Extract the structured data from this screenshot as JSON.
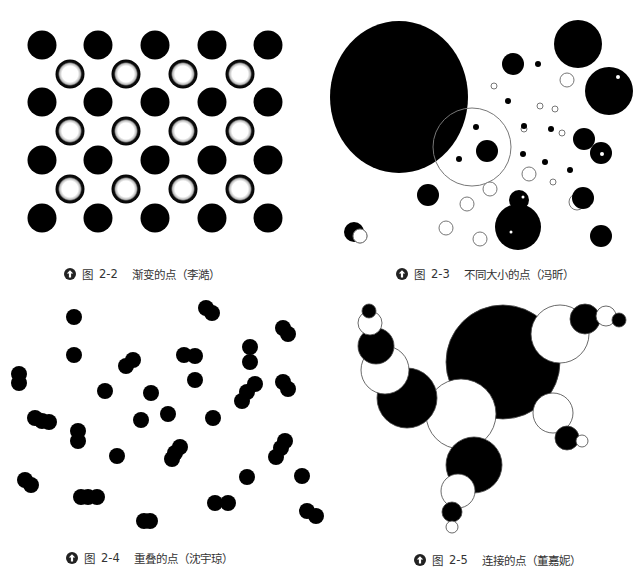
{
  "colors": {
    "ink": "#000000",
    "paper": "#ffffff",
    "outline": "#777777",
    "caption": "#333333"
  },
  "figures": [
    {
      "id": "2-2",
      "caption": {
        "prefix": "图",
        "number": "2-2",
        "title": "渐变的点（李澔）",
        "icon": "up-arrow-circle-icon",
        "x": 64,
        "y": 266
      },
      "solid_dots": [
        [
          42,
          45
        ],
        [
          98,
          45
        ],
        [
          155,
          45
        ],
        [
          212,
          45
        ],
        [
          268,
          45
        ],
        [
          42,
          102
        ],
        [
          98,
          102
        ],
        [
          155,
          102
        ],
        [
          212,
          102
        ],
        [
          268,
          102
        ],
        [
          42,
          160
        ],
        [
          98,
          160
        ],
        [
          155,
          160
        ],
        [
          212,
          160
        ],
        [
          268,
          160
        ],
        [
          42,
          218
        ],
        [
          98,
          218
        ],
        [
          155,
          218
        ],
        [
          212,
          218
        ],
        [
          268,
          218
        ]
      ],
      "ring_dots": [
        [
          70,
          74
        ],
        [
          126,
          74
        ],
        [
          183,
          74
        ],
        [
          240,
          74
        ],
        [
          70,
          131
        ],
        [
          126,
          131
        ],
        [
          183,
          131
        ],
        [
          240,
          131
        ],
        [
          70,
          189
        ],
        [
          126,
          189
        ],
        [
          183,
          189
        ],
        [
          240,
          189
        ]
      ],
      "radius": 14.5
    },
    {
      "id": "2-3",
      "caption": {
        "prefix": "图",
        "number": "2-3",
        "title": "不同大小的点（冯昕）",
        "icon": "up-arrow-circle-icon",
        "x": 396,
        "y": 266
      },
      "big_ellipse": {
        "cx": 399,
        "cy": 97,
        "rx": 69,
        "ry": 76
      },
      "outline_big": {
        "cx": 472,
        "cy": 147,
        "r": 39
      },
      "solid": [
        [
          578,
          44,
          24
        ],
        [
          513,
          64,
          11
        ],
        [
          538,
          64,
          3
        ],
        [
          508,
          101,
          3
        ],
        [
          609,
          91,
          24
        ],
        [
          476,
          127,
          3
        ],
        [
          487,
          151,
          11
        ],
        [
          459,
          159,
          3
        ],
        [
          584,
          139,
          11
        ],
        [
          601,
          153,
          11
        ],
        [
          524,
          126,
          3
        ],
        [
          551,
          129,
          3
        ],
        [
          523,
          154,
          3
        ],
        [
          545,
          162,
          3
        ],
        [
          570,
          170,
          3
        ],
        [
          428,
          195,
          11
        ],
        [
          519,
          200,
          10
        ],
        [
          518,
          227,
          23
        ],
        [
          583,
          198,
          11
        ],
        [
          601,
          236,
          11
        ],
        [
          354,
          232,
          10
        ]
      ],
      "outline": [
        [
          567,
          80,
          7
        ],
        [
          494,
          86,
          3
        ],
        [
          540,
          106,
          3
        ],
        [
          555,
          109,
          3
        ],
        [
          524,
          129,
          3
        ],
        [
          562,
          133,
          3
        ],
        [
          529,
          174,
          7
        ],
        [
          553,
          182,
          3
        ],
        [
          490,
          189,
          7
        ],
        [
          467,
          204,
          7
        ],
        [
          446,
          228,
          7
        ],
        [
          480,
          239,
          7
        ],
        [
          360,
          236,
          7
        ],
        [
          577,
          202,
          8
        ]
      ],
      "highlights": [
        [
          618,
          77,
          2
        ],
        [
          602,
          154,
          2
        ],
        [
          523,
          197,
          1.5
        ],
        [
          511,
          232,
          1.5
        ],
        [
          592,
          206,
          1.5
        ]
      ]
    },
    {
      "id": "2-4",
      "caption": {
        "prefix": "图",
        "number": "2-4",
        "title": "重叠的点（沈宇琼）",
        "icon": "up-arrow-circle-icon",
        "x": 66,
        "y": 550
      },
      "radius": 8,
      "dots": [
        [
          74,
          317
        ],
        [
          206,
          308
        ],
        [
          212,
          313
        ],
        [
          74,
          355
        ],
        [
          283,
          328
        ],
        [
          288,
          334
        ],
        [
          250,
          347
        ],
        [
          250,
          362
        ],
        [
          133,
          360
        ],
        [
          126,
          366
        ],
        [
          184,
          355
        ],
        [
          195,
          356
        ],
        [
          195,
          380
        ],
        [
          19,
          374
        ],
        [
          19,
          383
        ],
        [
          105,
          391
        ],
        [
          151,
          393
        ],
        [
          255,
          384
        ],
        [
          247,
          392
        ],
        [
          242,
          401
        ],
        [
          283,
          382
        ],
        [
          288,
          389
        ],
        [
          35,
          418
        ],
        [
          42,
          421
        ],
        [
          49,
          422
        ],
        [
          141,
          420
        ],
        [
          168,
          414
        ],
        [
          213,
          418
        ],
        [
          78,
          431
        ],
        [
          78,
          441
        ],
        [
          180,
          447
        ],
        [
          175,
          453
        ],
        [
          172,
          459
        ],
        [
          117,
          456
        ],
        [
          285,
          441
        ],
        [
          281,
          448
        ],
        [
          276,
          457
        ],
        [
          247,
          477
        ],
        [
          302,
          476
        ],
        [
          25,
          480
        ],
        [
          31,
          485
        ],
        [
          81,
          497
        ],
        [
          88,
          497
        ],
        [
          97,
          497
        ],
        [
          215,
          503
        ],
        [
          228,
          503
        ],
        [
          144,
          521
        ],
        [
          150,
          521
        ],
        [
          307,
          511
        ],
        [
          316,
          516
        ]
      ]
    },
    {
      "id": "2-5",
      "caption": {
        "prefix": "图",
        "number": "2-5",
        "title": "连接的点（董嘉妮）",
        "icon": "up-arrow-circle-icon",
        "x": 414,
        "y": 552
      },
      "chain": [
        {
          "cx": 503,
          "cy": 362,
          "r": 57,
          "fill": "black"
        },
        {
          "cx": 461,
          "cy": 414,
          "r": 35,
          "fill": "white"
        },
        {
          "cx": 407,
          "cy": 398,
          "r": 30,
          "fill": "black"
        },
        {
          "cx": 385,
          "cy": 370,
          "r": 24,
          "fill": "white"
        },
        {
          "cx": 376,
          "cy": 346,
          "r": 18,
          "fill": "black"
        },
        {
          "cx": 370,
          "cy": 323,
          "r": 12,
          "fill": "white"
        },
        {
          "cx": 369,
          "cy": 311,
          "r": 7,
          "fill": "black"
        },
        {
          "cx": 560,
          "cy": 334,
          "r": 29,
          "fill": "white"
        },
        {
          "cx": 585,
          "cy": 319,
          "r": 15,
          "fill": "black"
        },
        {
          "cx": 606,
          "cy": 316,
          "r": 10,
          "fill": "white"
        },
        {
          "cx": 619,
          "cy": 320,
          "r": 7,
          "fill": "black"
        },
        {
          "cx": 553,
          "cy": 413,
          "r": 20,
          "fill": "white"
        },
        {
          "cx": 567,
          "cy": 438,
          "r": 12,
          "fill": "black"
        },
        {
          "cx": 582,
          "cy": 441,
          "r": 6,
          "fill": "white"
        },
        {
          "cx": 474,
          "cy": 465,
          "r": 28,
          "fill": "black"
        },
        {
          "cx": 458,
          "cy": 491,
          "r": 17,
          "fill": "white"
        },
        {
          "cx": 452,
          "cy": 512,
          "r": 10,
          "fill": "black"
        },
        {
          "cx": 452,
          "cy": 527,
          "r": 6,
          "fill": "white"
        }
      ]
    }
  ]
}
